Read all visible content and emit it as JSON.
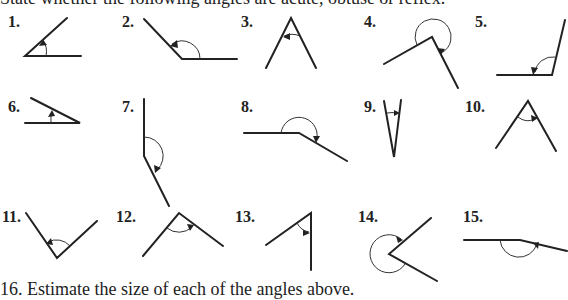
{
  "instructions": {
    "top": "State whether the following angles are acute, obtuse or reflex.",
    "bottom": "16. Estimate the size of each of the angles above."
  },
  "figures": [
    {
      "label": "1."
    },
    {
      "label": "2."
    },
    {
      "label": "3."
    },
    {
      "label": "4."
    },
    {
      "label": "5."
    },
    {
      "label": "6."
    },
    {
      "label": "7."
    },
    {
      "label": "8."
    },
    {
      "label": "9."
    },
    {
      "label": "10."
    },
    {
      "label": "11."
    },
    {
      "label": "12."
    },
    {
      "label": "13."
    },
    {
      "label": "14."
    },
    {
      "label": "15."
    }
  ]
}
